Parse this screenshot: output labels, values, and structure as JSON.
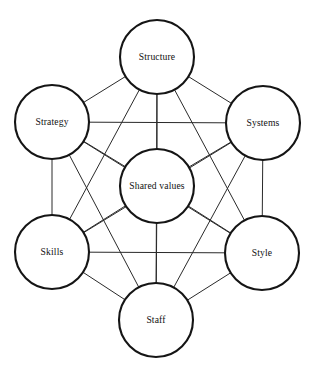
{
  "diagram": {
    "type": "network-diagram",
    "canvas": {
      "width": 314,
      "height": 369
    },
    "background_color": "#ffffff",
    "node_stroke_color": "#151515",
    "node_fill_color": "#ffffff",
    "node_stroke_width": 2.1,
    "edge_stroke_color": "#2a2a2a",
    "edge_stroke_width": 1,
    "label_color": "#111111",
    "label_font_size": 9.6,
    "layout": "hexagon-with-center-hub",
    "nodes": [
      {
        "id": "structure",
        "label": "Structure",
        "cx": 157,
        "cy": 57,
        "r": 37
      },
      {
        "id": "systems",
        "label": "Systems",
        "cx": 263,
        "cy": 123,
        "r": 37
      },
      {
        "id": "style",
        "label": "Style",
        "cx": 262,
        "cy": 253,
        "r": 37
      },
      {
        "id": "staff",
        "label": "Staff",
        "cx": 156,
        "cy": 320,
        "r": 37
      },
      {
        "id": "skills",
        "label": "Skills",
        "cx": 52,
        "cy": 252,
        "r": 37
      },
      {
        "id": "strategy",
        "label": "Strategy",
        "cx": 52,
        "cy": 122,
        "r": 37
      },
      {
        "id": "shared_values",
        "label": "Shared values",
        "cx": 157,
        "cy": 186,
        "r": 37
      }
    ],
    "edges": [
      {
        "from": "structure",
        "to": "systems"
      },
      {
        "from": "structure",
        "to": "style"
      },
      {
        "from": "structure",
        "to": "staff"
      },
      {
        "from": "structure",
        "to": "skills"
      },
      {
        "from": "structure",
        "to": "strategy"
      },
      {
        "from": "structure",
        "to": "shared_values"
      },
      {
        "from": "systems",
        "to": "style"
      },
      {
        "from": "systems",
        "to": "staff"
      },
      {
        "from": "systems",
        "to": "skills"
      },
      {
        "from": "systems",
        "to": "strategy"
      },
      {
        "from": "systems",
        "to": "shared_values"
      },
      {
        "from": "style",
        "to": "staff"
      },
      {
        "from": "style",
        "to": "skills"
      },
      {
        "from": "style",
        "to": "strategy"
      },
      {
        "from": "style",
        "to": "shared_values"
      },
      {
        "from": "staff",
        "to": "skills"
      },
      {
        "from": "staff",
        "to": "strategy"
      },
      {
        "from": "staff",
        "to": "shared_values"
      },
      {
        "from": "skills",
        "to": "strategy"
      },
      {
        "from": "skills",
        "to": "shared_values"
      },
      {
        "from": "strategy",
        "to": "shared_values"
      }
    ]
  }
}
